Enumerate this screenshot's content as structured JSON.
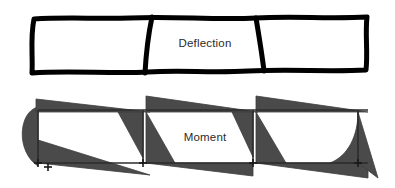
{
  "figure": {
    "width": 395,
    "height": 188,
    "background_color": "#ffffff"
  },
  "colors": {
    "outline": "#000000",
    "moment_fill": "#4a4a4a",
    "moment_stroke": "#3d3d3d",
    "baseline": "#2d2d2d",
    "support_marker": "#1a1a1a",
    "label_text": "#2b2b2b"
  },
  "deflection_diagram": {
    "label": "Deflection",
    "label_x": 205,
    "label_y": 44,
    "stroke_width": 5,
    "fill": "#ffffff",
    "outline_path": "M 34 19 C 30 38, 33 56, 32 73 C 70 70, 110 74, 148 72 C 180 70, 212 73, 248 71 C 290 69, 330 72, 366 70 C 368 52, 365 34, 367 17 C 330 19, 292 16, 256 18 C 214 20, 172 16, 130 18 C 98 19, 64 17, 34 19 Z",
    "top_edge_path": "M 34 19 C 64 17, 98 19, 130 18 C 172 16, 214 20, 256 18 C 292 16, 330 19, 367 17",
    "bottom_edge_path": "M 32 73 C 70 70, 110 74, 148 72 C 180 70, 212 73, 248 71 C 290 69, 330 72, 366 70",
    "left_edge_path": "M 34 19 C 30 38, 33 56, 32 73",
    "right_edge_path": "M 367 17 C 365 34, 368 52, 366 70",
    "interior_dividers": [
      {
        "name": "divider-1",
        "path": "M 152 17 C 148 36, 146 55, 145 73"
      },
      {
        "name": "divider-2",
        "path": "M 256 18 C 259 36, 262 54, 264 71"
      }
    ],
    "panel_count": 3
  },
  "moment_diagram": {
    "label": "Moment",
    "label_x": 205,
    "label_y": 138,
    "baseline": {
      "y_top": 110,
      "y_bottom": 163,
      "x_start": 38,
      "x_end": 368,
      "stroke_width": 1.6
    },
    "support_markers": [
      {
        "name": "support-1",
        "x": 38,
        "y": 163
      },
      {
        "name": "support-2",
        "x": 48,
        "y": 167
      },
      {
        "name": "support-3",
        "x": 143,
        "y": 163
      },
      {
        "name": "support-4",
        "x": 253,
        "y": 163
      },
      {
        "name": "support-5",
        "x": 358,
        "y": 163
      }
    ],
    "shapes": [
      {
        "name": "end-cantilever-bulge-left",
        "kind": "parabolic-bulge",
        "path": "M 38 107 C 18 112, 16 152, 38 166 L 38 107 Z"
      },
      {
        "name": "span-1-hogging-wedge-top",
        "kind": "triangle",
        "path": "M 36 99 L 150 112 L 36 112 Z"
      },
      {
        "name": "span-1-sagging-wedge-bottom",
        "kind": "triangle",
        "path": "M 38 140 L 150 175 L 38 163 Z"
      },
      {
        "name": "span-1-interior-wedge",
        "kind": "triangle",
        "path": "M 118 112 L 143 112 L 143 158 Z"
      },
      {
        "name": "span-2-hogging-wedge-top",
        "kind": "triangle",
        "path": "M 146 96 L 258 112 L 146 112 Z"
      },
      {
        "name": "span-2-sagging-wedge-bottom",
        "kind": "triangle",
        "path": "M 146 112 L 146 163 L 175 163 Z"
      },
      {
        "name": "span-2-right-wedge",
        "kind": "triangle",
        "path": "M 232 112 L 253 112 L 253 157 Z"
      },
      {
        "name": "span-2-base-wedge",
        "kind": "triangle",
        "path": "M 146 163 L 253 163 L 253 176 Z"
      },
      {
        "name": "span-3-hogging-wedge-top",
        "kind": "triangle",
        "path": "M 256 96 L 368 112 L 256 112 Z"
      },
      {
        "name": "span-3-sagging-wedge-bottom",
        "kind": "triangle",
        "path": "M 256 112 L 256 163 L 286 163 Z"
      },
      {
        "name": "span-3-base-wedge",
        "kind": "triangle",
        "path": "M 256 163 L 368 163 L 368 178 Z"
      },
      {
        "name": "end-curved-wedge-right",
        "kind": "parabolic-wedge",
        "path": "M 358 112 C 358 136, 348 156, 330 163 L 358 163 Z"
      },
      {
        "name": "end-tail-right",
        "kind": "triangle",
        "path": "M 358 112 L 378 178 L 358 163 Z"
      }
    ]
  }
}
